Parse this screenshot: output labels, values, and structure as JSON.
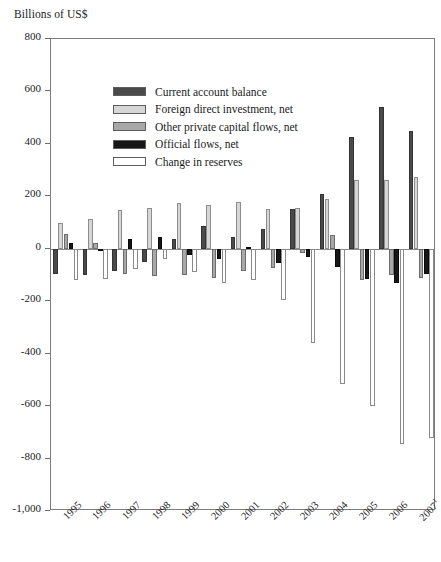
{
  "unit_label": "Billions of US$",
  "legend": {
    "position": "inside-top-left",
    "items": [
      {
        "label": "Current account balance",
        "color": "#4a4a4a",
        "swatch": "series-swatch-current-account"
      },
      {
        "label": "Foreign direct investment, net",
        "color": "#d6d6d6",
        "swatch": "series-swatch-fdi"
      },
      {
        "label": "Other private capital flows, net",
        "color": "#a8a8a8",
        "swatch": "series-swatch-other-private"
      },
      {
        "label": "Official flows, net",
        "color": "#171717",
        "swatch": "series-swatch-official"
      },
      {
        "label": "Change in reserves",
        "color": "#ffffff",
        "swatch": "series-swatch-reserves"
      }
    ]
  },
  "chart_data": {
    "type": "bar",
    "title": "",
    "subtitle": "",
    "xlabel": "",
    "ylabel": "Billions of US$",
    "ylim": [
      -1000,
      800
    ],
    "yticks": [
      800,
      600,
      400,
      200,
      0,
      -200,
      -400,
      -600,
      -800,
      -1000
    ],
    "ytick_labels": [
      "800",
      "600",
      "400",
      "200",
      "0",
      "-200",
      "-400",
      "-600",
      "-800",
      "-1,000"
    ],
    "grid": false,
    "categories": [
      "1995",
      "1996",
      "1997",
      "1998",
      "1999",
      "2000",
      "2001",
      "2002",
      "2003",
      "2004",
      "2005",
      "2006",
      "2007"
    ],
    "category_labels": [
      "1995",
      "1996",
      "1997",
      "1998",
      "1999",
      "2000",
      "2001",
      "2002",
      "2003",
      "2004",
      "2005",
      "2006",
      "2007¹"
    ],
    "footnote_marker": "1",
    "series": [
      {
        "name": "Current account balance",
        "color": "#4a4a4a",
        "values": [
          -95,
          -100,
          -83,
          -52,
          38,
          88,
          45,
          77,
          150,
          210,
          425,
          540,
          450
        ]
      },
      {
        "name": "Foreign direct investment, net",
        "color": "#d6d6d6",
        "values": [
          98,
          113,
          148,
          155,
          175,
          167,
          180,
          150,
          155,
          190,
          262,
          262,
          275
        ]
      },
      {
        "name": "Other private capital flows, net",
        "color": "#a8a8a8",
        "values": [
          58,
          22,
          -95,
          -105,
          -100,
          -110,
          -85,
          -75,
          -15,
          52,
          -120,
          -100,
          -110
        ]
      },
      {
        "name": "Official flows, net",
        "color": "#171717",
        "values": [
          23,
          -10,
          38,
          45,
          -22,
          -40,
          8,
          -55,
          -30,
          -70,
          -115,
          -130,
          -95
        ]
      },
      {
        "name": "Change in reserves",
        "color": "#ffffff",
        "values": [
          -118,
          -115,
          -78,
          -38,
          -88,
          -130,
          -118,
          -195,
          -360,
          -515,
          -600,
          -745,
          -720
        ]
      }
    ]
  }
}
